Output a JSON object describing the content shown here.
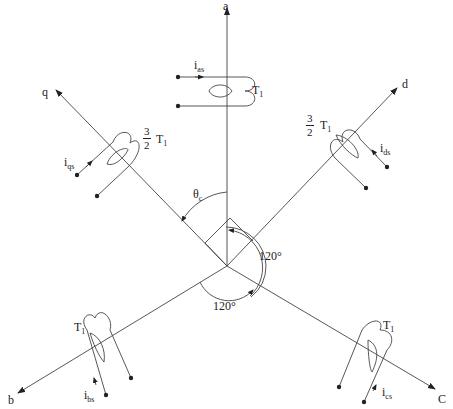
{
  "diagram": {
    "axes": [
      {
        "id": "a",
        "label": "a"
      },
      {
        "id": "b",
        "label": "b"
      },
      {
        "id": "c",
        "label": "C"
      },
      {
        "id": "d",
        "label": "d"
      },
      {
        "id": "q",
        "label": "q"
      }
    ],
    "windings": [
      {
        "axis": "a",
        "current": "i",
        "current_sub": "as",
        "turns": "T",
        "turns_sub": "1",
        "factor": ""
      },
      {
        "axis": "b",
        "current": "i",
        "current_sub": "bs",
        "turns": "T",
        "turns_sub": "1",
        "factor": ""
      },
      {
        "axis": "c",
        "current": "i",
        "current_sub": "cs",
        "turns": "T",
        "turns_sub": "1",
        "factor": ""
      },
      {
        "axis": "d",
        "current": "i",
        "current_sub": "ds",
        "turns": "T",
        "turns_sub": "1",
        "factor_num": "3",
        "factor_den": "2"
      },
      {
        "axis": "q",
        "current": "i",
        "current_sub": "qs",
        "turns": "T",
        "turns_sub": "1",
        "factor_num": "3",
        "factor_den": "2"
      }
    ],
    "angles": {
      "theta": "θ",
      "theta_sub": "c",
      "angle_ab": "120°",
      "angle_bc": "120°"
    },
    "colors": {
      "line": "#333333",
      "background": "#ffffff"
    }
  }
}
